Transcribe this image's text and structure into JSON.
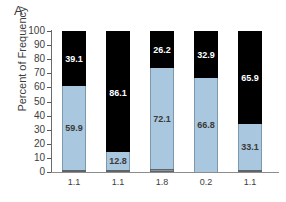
{
  "panel": {
    "label": "A"
  },
  "axes": {
    "ylabel": "Percent of Frequency",
    "yticks": [
      "100",
      "90",
      "80",
      "70",
      "60",
      "50",
      "40",
      "30",
      "20",
      "10",
      "0"
    ],
    "ylim": [
      0,
      100
    ]
  },
  "colors": {
    "top_segment": "#000000",
    "middle_segment": "#a9c7de",
    "bottom_segment": "#8e9499",
    "axis": "#6a6a6a",
    "text": "#3d3d3d"
  },
  "chart_data": {
    "type": "bar",
    "title": "",
    "xlabel": "",
    "ylabel": "Percent of Frequency",
    "ylim": [
      0,
      100
    ],
    "grid": false,
    "legend": "none",
    "stacked": true,
    "categories": [
      "1",
      "2",
      "3",
      "4",
      "5"
    ],
    "xtick_labels": [
      "1.1",
      "1.1",
      "1.8",
      "0.2",
      "1.1"
    ],
    "series": [
      {
        "name": "bottom",
        "color": "#8e9499",
        "values": [
          1.1,
          1.1,
          1.8,
          0.2,
          1.1
        ],
        "labels": [
          "1.1",
          "1.1",
          "1.8",
          "0.2",
          "1.1"
        ],
        "labels_position": "below-axis"
      },
      {
        "name": "middle",
        "color": "#a9c7de",
        "values": [
          59.9,
          12.8,
          72.1,
          66.8,
          33.1
        ],
        "labels": [
          "59.9",
          "12.8",
          "72.1",
          "66.8",
          "33.1"
        ]
      },
      {
        "name": "top",
        "color": "#000000",
        "values": [
          39.1,
          86.1,
          26.2,
          32.9,
          65.9
        ],
        "labels": [
          "39.1",
          "86.1",
          "26.2",
          "32.9",
          "65.9"
        ]
      }
    ]
  }
}
